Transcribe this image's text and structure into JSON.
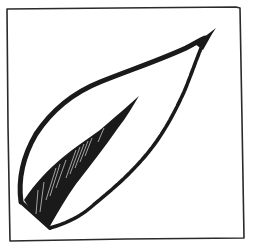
{
  "image": {
    "description": "Hand-drawn ink sketch of a single leaf inside a square frame",
    "subject": "leaf",
    "style": "pen-and-ink sketch with hatching",
    "colors": {
      "ink": "#1a1a1a",
      "paper": "#ffffff",
      "frame": "#2a2a2a"
    },
    "elements": [
      {
        "name": "frame",
        "label": "Square frame border"
      },
      {
        "name": "leaf-outline",
        "label": "Leaf outline"
      },
      {
        "name": "leaf-midrib",
        "label": "Hatched midrib stroke"
      },
      {
        "name": "leaf-tip",
        "label": "Pointed leaf tip"
      },
      {
        "name": "leaf-base",
        "label": "Hatched leaf base"
      }
    ]
  }
}
